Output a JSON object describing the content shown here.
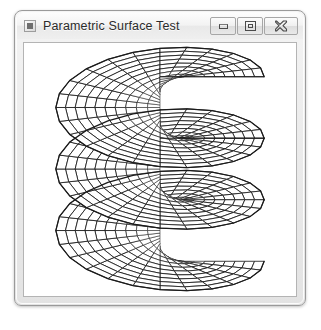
{
  "window": {
    "title": "Parametric Surface Test",
    "app_icon": "application-icon",
    "caption_buttons": [
      {
        "name": "minimize-button",
        "label": "Minimize",
        "glyph": "minimize-icon"
      },
      {
        "name": "maximize-button",
        "label": "Maximize",
        "glyph": "maximize-icon"
      },
      {
        "name": "close-button",
        "label": "Close",
        "glyph": "close-icon"
      }
    ]
  },
  "colors": {
    "frame_border": "#9a9a9a",
    "titlebar_bg": "#f0f0f0",
    "title_text": "#2b2b2b",
    "client_bg": "#ffffff",
    "client_border": "#b4b4b4",
    "mesh_stroke": "#1a1a1a",
    "face_fill": "#ffffff"
  },
  "chart_data": {
    "type": "surface-wireframe",
    "title": "Parametric Surface Test",
    "surface_name": "helicoid",
    "render_style": "hidden-line wireframe, white faces, black edges",
    "background": "#ffffff",
    "stroke": "#1a1a1a",
    "parameters": {
      "u_label": "radius",
      "v_label": "angle",
      "u_range": [
        0.0,
        1.0
      ],
      "v_range": [
        0.0,
        1080.0
      ],
      "v_units": "degrees",
      "turns": 3,
      "radial_divisions": 10,
      "angular_divisions_per_turn": 24,
      "pitch_per_turn": 62,
      "max_radius": 105
    },
    "projection": {
      "type": "oblique-isometric",
      "elevation_deg": 28,
      "azimuth_deg": 0,
      "y_scale": 0.42,
      "center_x": 137,
      "center_y": 127
    },
    "annotations": []
  }
}
